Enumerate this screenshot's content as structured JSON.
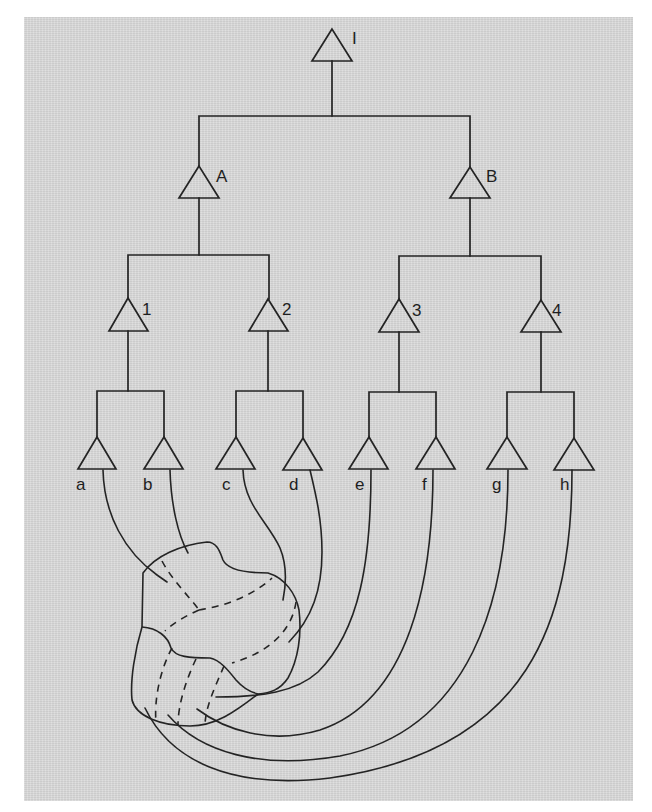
{
  "diagram": {
    "type": "hierarchical-tree-with-fibers",
    "colors": {
      "background": "#d9d9d9",
      "line": "#242424",
      "page": "#ffffff"
    },
    "root": {
      "label": "I"
    },
    "level1": [
      {
        "label": "A"
      },
      {
        "label": "B"
      }
    ],
    "level2": [
      {
        "label": "1"
      },
      {
        "label": "2"
      },
      {
        "label": "3"
      },
      {
        "label": "4"
      }
    ],
    "leaves": [
      {
        "label": "a"
      },
      {
        "label": "b"
      },
      {
        "label": "c"
      },
      {
        "label": "d"
      },
      {
        "label": "e"
      },
      {
        "label": "f"
      },
      {
        "label": "g"
      },
      {
        "label": "h"
      }
    ],
    "target_region": {
      "name": "irregular-region",
      "divisions": "dashed"
    }
  }
}
